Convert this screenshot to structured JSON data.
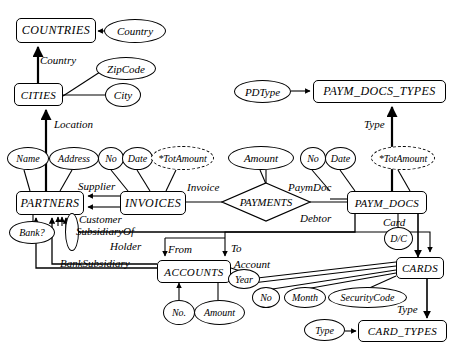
{
  "diagram": {
    "entities": [
      {
        "id": "countries",
        "label": "COUNTRIES",
        "x": 16,
        "y": 18,
        "w": 80,
        "h": 25,
        "fs": 12
      },
      {
        "id": "cities",
        "label": "CITIES",
        "x": 14,
        "y": 83,
        "w": 49,
        "h": 23,
        "fs": 11
      },
      {
        "id": "paym_docs_types",
        "label": "PAYM_DOCS_TYPES",
        "x": 313,
        "y": 80,
        "w": 133,
        "h": 23,
        "fs": 12
      },
      {
        "id": "partners",
        "label": "PARTNERS",
        "x": 16,
        "y": 191,
        "w": 68,
        "h": 24,
        "fs": 12
      },
      {
        "id": "invoices",
        "label": "INVOICES",
        "x": 120,
        "y": 191,
        "w": 66,
        "h": 24,
        "fs": 12
      },
      {
        "id": "paym_docs",
        "label": "PAYM_DOCS",
        "x": 347,
        "y": 191,
        "w": 80,
        "h": 23,
        "fs": 11
      },
      {
        "id": "accounts",
        "label": "ACCOUNTS",
        "x": 157,
        "y": 260,
        "w": 74,
        "h": 23,
        "fs": 11
      },
      {
        "id": "cards",
        "label": "CARDS",
        "x": 396,
        "y": 257,
        "w": 48,
        "h": 22,
        "fs": 11
      },
      {
        "id": "card_types",
        "label": "CARD_TYPES",
        "x": 358,
        "y": 320,
        "w": 89,
        "h": 22,
        "fs": 11
      }
    ],
    "relationships": [
      {
        "id": "payments",
        "label": "PAYMENTS",
        "cx": 266,
        "cy": 202,
        "rx": 45,
        "ry": 20,
        "fs": 11
      }
    ],
    "attributes": [
      {
        "id": "country",
        "label": "Country",
        "x": 104,
        "y": 19,
        "w": 62,
        "h": 24,
        "fs": 11,
        "derived": false
      },
      {
        "id": "zipcode",
        "label": "ZipCode",
        "x": 96,
        "y": 57,
        "w": 60,
        "h": 23,
        "fs": 11,
        "derived": false
      },
      {
        "id": "city",
        "label": "City",
        "x": 105,
        "y": 83,
        "w": 36,
        "h": 24,
        "fs": 11,
        "derived": false
      },
      {
        "id": "pdtype",
        "label": "PDType",
        "x": 234,
        "y": 80,
        "w": 57,
        "h": 23,
        "fs": 11,
        "derived": false
      },
      {
        "id": "name",
        "label": "Name",
        "x": 7,
        "y": 147,
        "w": 42,
        "h": 23,
        "fs": 10,
        "derived": false
      },
      {
        "id": "address",
        "label": "Address",
        "x": 49,
        "y": 147,
        "w": 50,
        "h": 23,
        "fs": 10,
        "derived": false
      },
      {
        "id": "inv_no",
        "label": "No",
        "x": 98,
        "y": 147,
        "w": 26,
        "h": 23,
        "fs": 10,
        "derived": false
      },
      {
        "id": "inv_date",
        "label": "Date",
        "x": 122,
        "y": 147,
        "w": 31,
        "h": 23,
        "fs": 10,
        "derived": false
      },
      {
        "id": "inv_totamount",
        "label": "*TotAmount",
        "x": 151,
        "y": 146,
        "w": 63,
        "h": 24,
        "fs": 10,
        "derived": true
      },
      {
        "id": "amount",
        "label": "Amount",
        "x": 228,
        "y": 146,
        "w": 66,
        "h": 24,
        "fs": 11,
        "derived": false
      },
      {
        "id": "pd_no",
        "label": "No",
        "x": 300,
        "y": 147,
        "w": 26,
        "h": 23,
        "fs": 10,
        "derived": false
      },
      {
        "id": "pd_date",
        "label": "Date",
        "x": 325,
        "y": 147,
        "w": 31,
        "h": 23,
        "fs": 10,
        "derived": false
      },
      {
        "id": "pd_totamount",
        "label": "*TotAmount",
        "x": 371,
        "y": 146,
        "w": 64,
        "h": 24,
        "fs": 10,
        "derived": true
      },
      {
        "id": "bank",
        "label": "Bank?",
        "x": 9,
        "y": 221,
        "w": 46,
        "h": 23,
        "fs": 10,
        "derived": false
      },
      {
        "id": "dc",
        "label": "D/C",
        "x": 384,
        "y": 227,
        "w": 29,
        "h": 23,
        "fs": 10,
        "derived": false
      },
      {
        "id": "acc_no",
        "label": "No.",
        "x": 163,
        "y": 300,
        "w": 32,
        "h": 25,
        "fs": 10,
        "derived": false
      },
      {
        "id": "acc_amount",
        "label": "Amount",
        "x": 194,
        "y": 300,
        "w": 51,
        "h": 25,
        "fs": 10,
        "derived": false
      },
      {
        "id": "year",
        "label": "Year",
        "x": 228,
        "y": 269,
        "w": 32,
        "h": 20,
        "fs": 10,
        "derived": false
      },
      {
        "id": "card_no",
        "label": "No",
        "x": 252,
        "y": 287,
        "w": 28,
        "h": 21,
        "fs": 10,
        "derived": false
      },
      {
        "id": "month",
        "label": "Month",
        "x": 284,
        "y": 287,
        "w": 42,
        "h": 21,
        "fs": 10,
        "derived": false
      },
      {
        "id": "securitycode",
        "label": "SecurityCode",
        "x": 328,
        "y": 287,
        "w": 79,
        "h": 21,
        "fs": 10,
        "derived": false
      },
      {
        "id": "ct_type",
        "label": "Type",
        "x": 304,
        "y": 319,
        "w": 41,
        "h": 22,
        "fs": 10,
        "derived": false
      },
      {
        "id": "subsidiary_loop",
        "label": "",
        "x": 65,
        "y": 213,
        "w": 14,
        "h": 38,
        "fs": 9,
        "derived": false
      }
    ],
    "edge_labels": [
      {
        "id": "country-role",
        "label": "Country",
        "x": 40,
        "y": 54,
        "fs": 11
      },
      {
        "id": "location-role",
        "label": "Location",
        "x": 54,
        "y": 118,
        "fs": 11
      },
      {
        "id": "type-pdt-role",
        "label": "Type",
        "x": 364,
        "y": 118,
        "fs": 11
      },
      {
        "id": "supplier-role",
        "label": "Supplier",
        "x": 78,
        "y": 180,
        "fs": 11
      },
      {
        "id": "invoice-role",
        "label": "Invoice",
        "x": 187,
        "y": 181,
        "fs": 11
      },
      {
        "id": "paymdoc-role",
        "label": "PaymDoc",
        "x": 288,
        "y": 181,
        "fs": 11
      },
      {
        "id": "customer-role",
        "label": "Customer",
        "x": 79,
        "y": 213,
        "fs": 11
      },
      {
        "id": "debtor-role",
        "label": "Debtor",
        "x": 300,
        "y": 212,
        "fs": 11
      },
      {
        "id": "card-role",
        "label": "Card",
        "x": 383,
        "y": 216,
        "fs": 11
      },
      {
        "id": "subsidiaryof-role",
        "label": "SubsidiaryOf",
        "x": 76,
        "y": 225,
        "fs": 11
      },
      {
        "id": "holder-role",
        "label": "Holder",
        "x": 110,
        "y": 240,
        "fs": 11
      },
      {
        "id": "from-role",
        "label": "From",
        "x": 168,
        "y": 243,
        "fs": 11
      },
      {
        "id": "to-role",
        "label": "To",
        "x": 228,
        "y": 242,
        "fs": 11
      },
      {
        "id": "banksubsidiary-role",
        "label": "BankSubsidiary",
        "x": 60,
        "y": 257,
        "fs": 11
      },
      {
        "id": "account-role",
        "label": "Account",
        "x": 234,
        "y": 258,
        "fs": 11
      },
      {
        "id": "type-ct-role",
        "label": "Type",
        "x": 397,
        "y": 303,
        "fs": 11
      }
    ]
  }
}
